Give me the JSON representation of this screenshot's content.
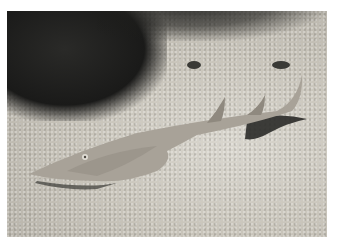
{
  "image": {
    "description": "Guitarfish (shovelnose ray) resting on a sandy seabed beside dark rocky reef",
    "subject": "guitarfish",
    "background": "sandy seabed with dark reef at top-left",
    "colors": {
      "border": "#ffffff",
      "sand": "#c9c5bb",
      "reef": "#1a1a19",
      "fish_body": "#a8a298",
      "fish_shadow": "#2a2a28"
    }
  }
}
